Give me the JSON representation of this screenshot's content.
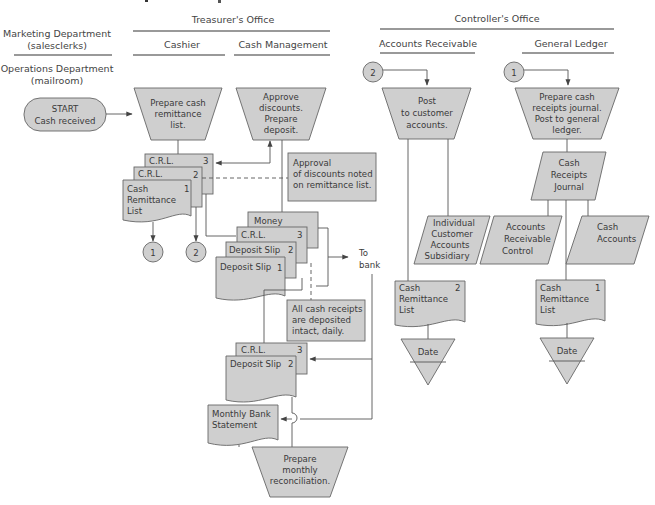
{
  "headers": {
    "marketing": [
      "Marketing Department",
      "(salesclerks)"
    ],
    "operations": [
      "Operations Department",
      "(mailroom)"
    ],
    "treasurer": "Treasurer's Office",
    "cashier": "Cashier",
    "cash_management": "Cash Management",
    "controller": "Controller's Office",
    "accounts_receivable": "Accounts Receivable",
    "general_ledger": "General Ledger"
  },
  "start": [
    "START",
    "Cash received"
  ],
  "processes": {
    "prepare_crl": [
      "Prepare cash",
      "remittance",
      "list."
    ],
    "approve": [
      "Approve",
      "discounts.",
      "Prepare",
      "deposit."
    ],
    "post_customer": [
      "Post",
      "to customer",
      "accounts."
    ],
    "prepare_journal": [
      "Prepare cash",
      "receipts journal.",
      "Post to general",
      "ledger."
    ],
    "reconcile": [
      "Prepare",
      "monthly",
      "reconciliation."
    ]
  },
  "documents": {
    "crl3": {
      "label": "C.R.L.",
      "num": "3"
    },
    "crl2": {
      "label": "C.R.L.",
      "num": "2"
    },
    "crl1": {
      "label": [
        "Cash",
        "Remittance",
        "List"
      ],
      "num": "1"
    },
    "money": {
      "label": "Money"
    },
    "dep_crl3": {
      "label": "C.R.L.",
      "num": "3"
    },
    "dep_slip2": {
      "label": "Deposit Slip",
      "num": "2"
    },
    "dep_slip1": {
      "label": "Deposit Slip",
      "num": "1"
    },
    "file_crl3": {
      "label": "C.R.L.",
      "num": "3"
    },
    "file_slip2": {
      "label": "Deposit Slip",
      "num": "2"
    },
    "bank_statement": {
      "label": [
        "Monthly Bank",
        "Statement"
      ]
    },
    "ar_crl2": {
      "label": [
        "Cash",
        "Remittance",
        "List"
      ],
      "num": "2"
    },
    "gl_crl1": {
      "label": [
        "Cash",
        "Remittance",
        "List"
      ],
      "num": "1"
    }
  },
  "ledgers": {
    "subsidiary": [
      "Individual",
      "Customer",
      "Accounts",
      "Subsidiary"
    ],
    "journal": [
      "Cash",
      "Receipts",
      "Journal"
    ],
    "ar_control": [
      "Accounts",
      "Receivable",
      "Control"
    ],
    "cash_accounts": [
      "Cash",
      "Accounts"
    ]
  },
  "annotations": {
    "approval": [
      "Approval",
      "of discounts noted",
      "on remittance list."
    ],
    "intact": [
      "All cash receipts",
      "are deposited",
      "intact, daily."
    ],
    "to_bank": [
      "To",
      "bank"
    ]
  },
  "connectors": {
    "c1": "1",
    "c2": "2"
  },
  "files": {
    "ar_date": "Date",
    "gl_date": "Date"
  },
  "colors": {
    "shape_fill": "#cfcfcf",
    "stroke": "#666666",
    "text": "#3a3a3a"
  }
}
